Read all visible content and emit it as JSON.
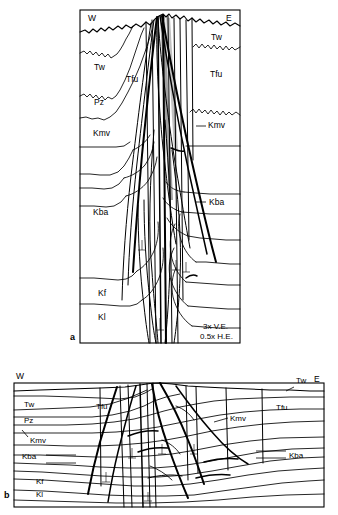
{
  "figure": {
    "background_color": "#ffffff",
    "line_color": "#000000",
    "panels": [
      {
        "id": "a",
        "letter": "a",
        "orientation_left": "W",
        "orientation_right": "E",
        "scale_notes": [
          "3x V.E.",
          "0.5x H.E."
        ],
        "unit_labels_west": [
          "Tw",
          "Tfu",
          "Pz",
          "Kmv",
          "Kba",
          "Kf",
          "Kl"
        ],
        "unit_labels_east": [
          "Tw",
          "Tfu",
          "Kmv",
          "Kba"
        ]
      },
      {
        "id": "b",
        "letter": "b",
        "orientation_left": "W",
        "orientation_right": "E",
        "unit_labels_west": [
          "Tw",
          "Pz",
          "Kmv",
          "Kba",
          "Kf",
          "Kl"
        ],
        "unit_labels_center": [
          "Tfu"
        ],
        "unit_labels_east": [
          "Tw",
          "Kmv",
          "Tfu",
          "Kba"
        ]
      }
    ]
  },
  "panel_a": {
    "letter": "a",
    "compass_w": "W",
    "compass_e": "E",
    "labels": {
      "tw_w": "Tw",
      "tfu_w": "Tfu",
      "pz_w": "Pz",
      "kmv_w": "Kmv",
      "kba_w": "Kba",
      "kf_w": "Kf",
      "kl_w": "Kl",
      "tw_e": "Tw",
      "tfu_e": "Tfu",
      "kmv_e": "Kmv",
      "kba_e": "Kba"
    },
    "scale_line_1": "3x V.E.",
    "scale_line_2": "0.5x H.E."
  },
  "panel_b": {
    "letter": "b",
    "compass_w": "W",
    "compass_e": "E",
    "labels": {
      "tw_w": "Tw",
      "pz_w": "Pz",
      "kmv_w": "Kmv",
      "kba_w": "Kba",
      "kf_w": "Kf",
      "kl_w": "Kl",
      "tfu_c": "Tfu",
      "kmv_e": "Kmv",
      "tfu_e": "Tfu",
      "kba_e": "Kba",
      "tw_e": "Tw"
    }
  },
  "colors": {
    "ink": "#000000",
    "paper": "#ffffff",
    "fault_zone_shade": "#555555"
  }
}
